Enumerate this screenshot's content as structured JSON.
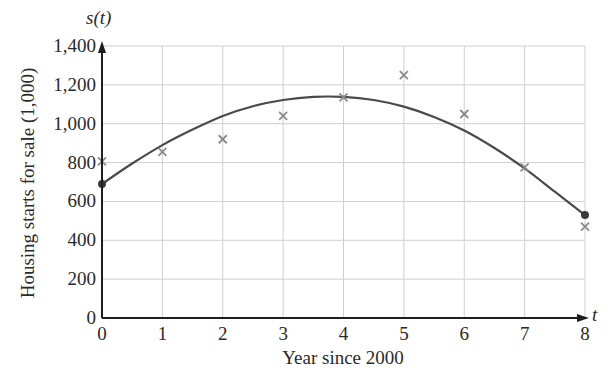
{
  "chart_data": {
    "type": "scatter",
    "title": "",
    "xlabel": "Year since 2000",
    "ylabel": "Housing starts for sale (1,000)",
    "x_axis_var": "t",
    "y_axis_var": "s(t)",
    "xlim": [
      0,
      8
    ],
    "ylim": [
      0,
      1400
    ],
    "x_ticks": [
      0,
      1,
      2,
      3,
      4,
      5,
      6,
      7,
      8
    ],
    "y_ticks": [
      0,
      200,
      400,
      600,
      800,
      1000,
      1200,
      1400
    ],
    "y_tick_labels": [
      "0",
      "200",
      "400",
      "600",
      "800",
      "1,000",
      "1,200",
      "1,400"
    ],
    "grid": true,
    "legend": null,
    "series": [
      {
        "name": "Observed housing starts",
        "type": "scatter",
        "marker": "x",
        "color": "#8a8a8a",
        "x": [
          0,
          1,
          2,
          3,
          4,
          5,
          6,
          7,
          8
        ],
        "values": [
          806,
          855,
          920,
          1040,
          1135,
          1250,
          1050,
          775,
          470
        ]
      },
      {
        "name": "Model s(t)",
        "type": "line",
        "color": "#4a4a4a",
        "x": [
          0,
          0.5,
          1,
          1.5,
          2,
          2.5,
          3,
          3.5,
          4,
          4.5,
          5,
          5.5,
          6,
          6.5,
          7,
          7.5,
          8
        ],
        "values": [
          690,
          795,
          890,
          970,
          1040,
          1090,
          1122,
          1138,
          1138,
          1122,
          1088,
          1035,
          965,
          875,
          770,
          650,
          530
        ],
        "endpoint_markers": [
          [
            0,
            690
          ],
          [
            8,
            530
          ]
        ]
      }
    ]
  },
  "colors": {
    "axis": "#1e1e1e",
    "grid": "#cfcfcf",
    "curve": "#4a4a4a",
    "marker": "#8a8a8a",
    "endpoint": "#3a3a3a"
  }
}
